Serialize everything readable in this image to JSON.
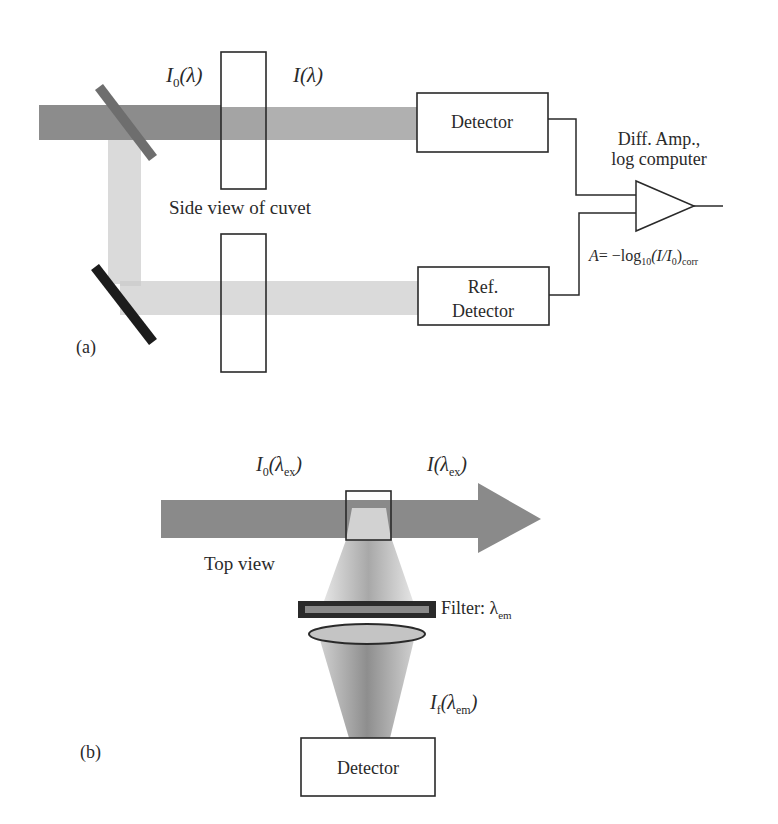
{
  "panel_a": {
    "label": "(a)",
    "incident_label": {
      "main": "I",
      "sub": "0",
      "rest": "(λ)"
    },
    "transmitted_label": {
      "main": "I",
      "rest": "(λ)"
    },
    "cuvet_caption": "Side view of cuvet",
    "detector_label": "Detector",
    "ref_detector_label_line1": "Ref.",
    "ref_detector_label_line2": "Detector",
    "amp_label_line1": "Diff. Amp.,",
    "amp_label_line2": "log computer",
    "equation": {
      "lhs": "A",
      "eq": "= −log",
      "sub10": "10",
      "paren": "(I/I",
      "sub0": "0",
      "close": ")",
      "subcorr": "corr"
    }
  },
  "panel_b": {
    "label": "(b)",
    "incident_label": {
      "main": "I",
      "sub": "0",
      "open": "(λ",
      "subex": "ex",
      "close": ")"
    },
    "transmitted_label": {
      "main": "I",
      "open": "(λ",
      "subex": "ex",
      "close": ")"
    },
    "view_caption": "Top view",
    "filter_label": {
      "text": "Filter: λ",
      "sub": "em"
    },
    "fluor_label": {
      "main": "I",
      "subf": "f",
      "open": "(λ",
      "subem": "em",
      "close": ")"
    },
    "detector_label": "Detector"
  },
  "colors": {
    "sample_beam": "#8c8c8c",
    "transmitted_beam": "#b0b0b0",
    "reference_beam": "#dadada",
    "beamsplitter": "#6e6e6e",
    "mirror": "#1c1c1c",
    "arrow": "#8a8a8a",
    "line": "#2a2a2a"
  }
}
